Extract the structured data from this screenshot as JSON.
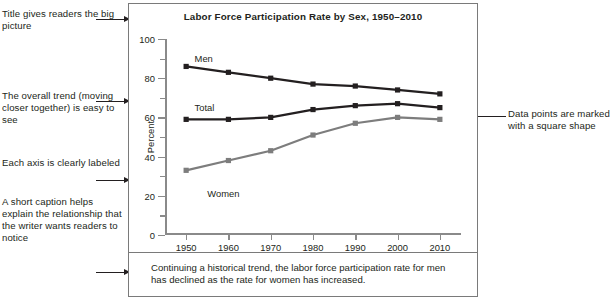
{
  "annotations": {
    "left": [
      {
        "name": "annotation-title",
        "text": "Title gives readers the big picture",
        "top": 8,
        "arrow_y": 19
      },
      {
        "name": "annotation-trend",
        "text": "The overall trend (moving closer together) is easy to see",
        "top": 90,
        "arrow_y": 101
      },
      {
        "name": "annotation-axes",
        "text": "Each axis is clearly labeled",
        "top": 157,
        "arrow_y": 180
      },
      {
        "name": "annotation-caption",
        "text": "A short caption helps explain the relationship that the writer wants readers to notice",
        "top": 196,
        "arrow_y": 272
      }
    ],
    "right": [
      {
        "name": "annotation-data-points",
        "text": "Data points are marked with a square shape",
        "top": 108,
        "arrow_y": 116
      }
    ]
  },
  "figure": {
    "caption": "Continuing a historical trend, the labor force participation rate for men has declined as the rate for women has increased."
  },
  "chart_data": {
    "type": "line",
    "title": "Labor Force Participation Rate by Sex, 1950–2010",
    "xlabel": "",
    "ylabel": "Percent",
    "categories": [
      1950,
      1960,
      1970,
      1980,
      1990,
      2000,
      2010
    ],
    "xtick_labels": [
      "1950",
      "1960",
      "1970",
      "1980",
      "1990",
      "2000",
      "2010"
    ],
    "ytick_labels": [
      "0",
      "20",
      "40",
      "60",
      "80",
      "100"
    ],
    "ytick_values": [
      0,
      20,
      40,
      60,
      80,
      100
    ],
    "yminor_values": [
      10,
      30,
      50,
      70,
      90
    ],
    "ylim": [
      0,
      100
    ],
    "xlim": [
      1945,
      2015
    ],
    "grid": false,
    "legend": "inline-labels",
    "marker": "square",
    "series": [
      {
        "name": "Men",
        "values": [
          86,
          83,
          80,
          77,
          76,
          74,
          72
        ],
        "color": "#231f20",
        "label_x": 1952,
        "label_y": 93
      },
      {
        "name": "Total",
        "values": [
          59,
          59,
          60,
          64,
          66,
          67,
          65
        ],
        "color": "#231f20",
        "label_x": 1952,
        "label_y": 68
      },
      {
        "name": "Women",
        "values": [
          33,
          38,
          43,
          51,
          57,
          60,
          59
        ],
        "color": "#7d7d7d",
        "label_x": 1955,
        "label_y": 24
      }
    ]
  }
}
